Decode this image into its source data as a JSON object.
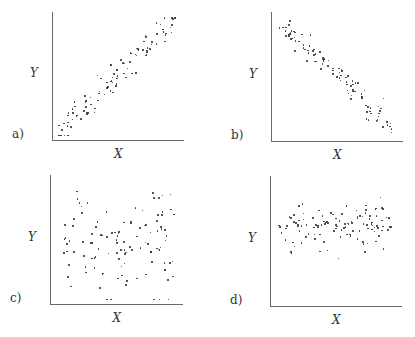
{
  "chart_data": [
    {
      "type": "scatter",
      "panel_label": "a)",
      "xlabel": "X",
      "ylabel": "Y",
      "description": "strong positive linear correlation",
      "grid": false,
      "correlation": "strong positive",
      "frame": {
        "ax": 52,
        "top": 12,
        "bottom": 140,
        "right": 184
      },
      "gen": {
        "n": 110,
        "slope": 1.0,
        "noise": 0.06,
        "x0": 0.02,
        "x1": 0.96,
        "y0": 0.05,
        "seed": 7
      }
    },
    {
      "type": "scatter",
      "panel_label": "b)",
      "xlabel": "X",
      "ylabel": "Y",
      "description": "strong negative linear correlation",
      "grid": false,
      "correlation": "strong negative",
      "frame": {
        "ax": 271,
        "top": 12,
        "bottom": 141,
        "right": 403
      },
      "gen": {
        "n": 105,
        "slope": -0.95,
        "noise": 0.05,
        "x0": 0.03,
        "x1": 0.93,
        "y0": 0.95,
        "seed": 13
      }
    },
    {
      "type": "scatter",
      "panel_label": "c)",
      "xlabel": "X",
      "ylabel": "Y",
      "description": "no correlation, widely dispersed",
      "grid": false,
      "correlation": "none (wide scatter)",
      "frame": {
        "ax": 50,
        "top": 175,
        "bottom": 304,
        "right": 183
      },
      "gen": {
        "n": 115,
        "slope": 0,
        "noise": 0.22,
        "x0": 0.08,
        "x1": 0.95,
        "y0": 0.5,
        "seed": 21
      }
    },
    {
      "type": "scatter",
      "panel_label": "d)",
      "xlabel": "X",
      "ylabel": "Y",
      "description": "no correlation, narrow horizontal band",
      "grid": false,
      "correlation": "none (horizontal band)",
      "frame": {
        "ax": 270,
        "top": 176,
        "bottom": 306,
        "right": 402
      },
      "gen": {
        "n": 120,
        "slope": 0.05,
        "noise": 0.09,
        "x0": 0.02,
        "x1": 0.97,
        "y0": 0.6,
        "seed": 33
      }
    }
  ]
}
